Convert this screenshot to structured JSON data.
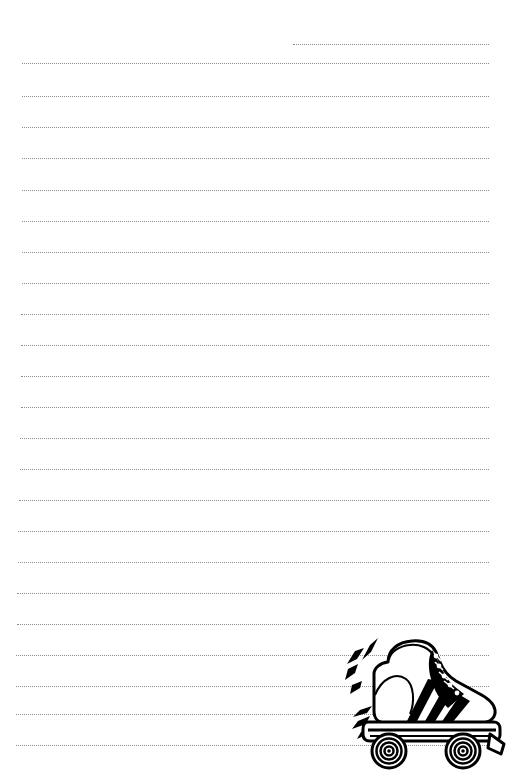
{
  "page": {
    "type": "lined-writing-paper",
    "width": 508,
    "height": 774,
    "background_color": "#ffffff"
  },
  "ruling": {
    "style": "dotted",
    "color": "#6e6e74",
    "line_spacing_px": 31,
    "count": 22,
    "lines": [
      {
        "index": 1,
        "y": 44,
        "x_start": 293,
        "x_end": 489
      },
      {
        "index": 2,
        "y": 63,
        "x_start": 22,
        "x_end": 489
      },
      {
        "index": 3,
        "y": 96,
        "x_start": 22,
        "x_end": 489
      },
      {
        "index": 4,
        "y": 127,
        "x_start": 22,
        "x_end": 489
      },
      {
        "index": 5,
        "y": 158,
        "x_start": 22,
        "x_end": 489
      },
      {
        "index": 6,
        "y": 190,
        "x_start": 22,
        "x_end": 489
      },
      {
        "index": 7,
        "y": 221,
        "x_start": 22,
        "x_end": 489
      },
      {
        "index": 8,
        "y": 252,
        "x_start": 22,
        "x_end": 489
      },
      {
        "index": 9,
        "y": 283,
        "x_start": 22,
        "x_end": 489
      },
      {
        "index": 10,
        "y": 314,
        "x_start": 21,
        "x_end": 489
      },
      {
        "index": 11,
        "y": 345,
        "x_start": 21,
        "x_end": 489
      },
      {
        "index": 12,
        "y": 376,
        "x_start": 21,
        "x_end": 489
      },
      {
        "index": 13,
        "y": 407,
        "x_start": 21,
        "x_end": 489
      },
      {
        "index": 14,
        "y": 438,
        "x_start": 20,
        "x_end": 489
      },
      {
        "index": 15,
        "y": 469,
        "x_start": 20,
        "x_end": 489
      },
      {
        "index": 16,
        "y": 500,
        "x_start": 19,
        "x_end": 489
      },
      {
        "index": 17,
        "y": 531,
        "x_start": 18,
        "x_end": 489
      },
      {
        "index": 18,
        "y": 562,
        "x_start": 18,
        "x_end": 489
      },
      {
        "index": 19,
        "y": 593,
        "x_start": 17,
        "x_end": 489
      },
      {
        "index": 20,
        "y": 624,
        "x_start": 17,
        "x_end": 489
      },
      {
        "index": 21,
        "y": 655,
        "x_start": 16,
        "x_end": 489
      },
      {
        "index": 22,
        "y": 686,
        "x_start": 16,
        "x_end": 489
      },
      {
        "index": 23,
        "y": 714,
        "x_start": 16,
        "x_end": 489
      },
      {
        "index": 24,
        "y": 745,
        "x_start": 16,
        "x_end": 489
      }
    ]
  },
  "illustration": {
    "name": "roller-skate",
    "description": "Black and white line-art roller skate boot with three stripes, laces and four wheels, with motion speed lines",
    "position": {
      "x": 344,
      "y": 634,
      "width": 162,
      "height": 136
    },
    "line_color": "#000000",
    "fill_color": "#ffffff",
    "accent_color": "#000000",
    "parts": [
      "boot",
      "lace-panel",
      "eyelets",
      "stripes",
      "sole-plate",
      "front-wheel",
      "rear-wheel",
      "toe-stop",
      "motion-lines"
    ]
  }
}
